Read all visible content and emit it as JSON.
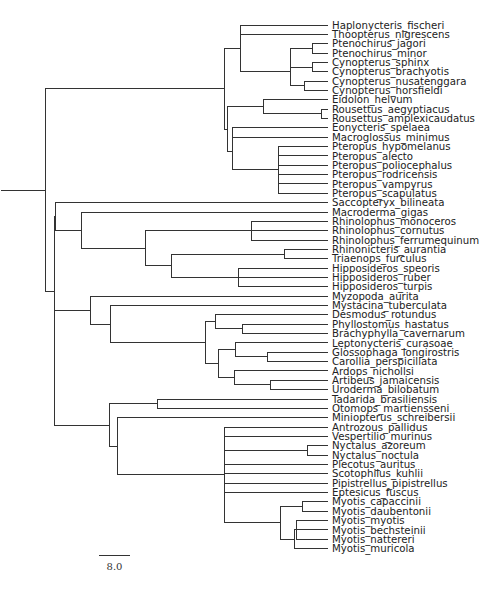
{
  "figure": {
    "type": "phylogenetic-tree",
    "scale_bar": {
      "label": "8.0",
      "x1": 99,
      "x2": 130,
      "y": 555
    }
  },
  "leaf_layout": {
    "x_label": 332,
    "y_start": 25,
    "y_step": 9.35
  },
  "leaves": [
    "Haplonycteris_fischeri",
    "Thoopterus_nigrescens",
    "Ptenochirus_jagori",
    "Ptenochirus_minor",
    "Cynopterus_sphinx",
    "Cynopterus_brachyotis",
    "Cynopterus_nusatenggara",
    "Cynopterus_horsfieldi",
    "Eidolon_helvum",
    "Rousettus_aegyptiacus",
    "Rousettus_amplexicaudatus",
    "Eonycteris_spelaea",
    "Macroglossus_minimus",
    "Pteropus_hypomelanus",
    "Pteropus_alecto",
    "Pteropus_poliocephalus",
    "Pteropus_rodricensis",
    "Pteropus_vampyrus",
    "Pteropus_scapulatus",
    "Saccopteryx_bilineata",
    "Macroderma_gigas",
    "Rhinolophus_monoceros",
    "Rhinolophus_cornutus",
    "Rhinolophus_ferrumequinum",
    "Rhinonicteris_aurantia",
    "Triaenops_furculus",
    "Hipposideros_speoris",
    "Hipposideros_ruber",
    "Hipposideros_turpis",
    "Myzopoda_aurita",
    "Mystacina_tuberculata",
    "Desmodus_rotundus",
    "Phyllostomus_hastatus",
    "Brachyphylla_cavernarum",
    "Leptonycteris_curasoae",
    "Glossophaga_longirostris",
    "Carollia_perspicillata",
    "Ardops_nichollsi",
    "Artibeus_jamaicensis",
    "Uroderma_bilobatum",
    "Tadarida_brasiliensis",
    "Otomops_martiensseni",
    "Miniopterus_schreibersii",
    "Antrozous_pallidus",
    "Vespertilio_murinus",
    "Nyctalus_azoreum",
    "Nyctalus_noctula",
    "Plecotus_auritus",
    "Scotophilus_kuhlii",
    "Pipistrellus_pipistrellus",
    "Eptesicus_fuscus",
    "Myotis_capaccinii",
    "Myotis_daubentonii",
    "Myotis_myotis",
    "Myotis_bechsteinii",
    "Myotis_nattereri",
    "Myotis_muricola"
  ],
  "tree": {
    "x": 15,
    "c": [
      {
        "x": 45,
        "c": [
          {
            "x": 224,
            "c": [
              {
                "x": 240,
                "c": [
                  {
                    "x": 240,
                    "c": [
                      0,
                      1,
                      {
                        "x": 290,
                        "c": [
                          {
                            "x": 290,
                            "c": [
                              {
                                "x": 312,
                                "c": [
                                  2,
                                  3
                                ]
                              },
                              {
                                "x": 312,
                                "c": [
                                  4,
                                  5
                                ]
                              }
                            ]
                          },
                          {
                            "x": 304,
                            "c": [
                              6,
                              7
                            ]
                          }
                        ]
                      }
                    ]
                  }
                ]
              },
              {
                "x": 227,
                "c": [
                  {
                    "x": 263,
                    "c": [
                      8,
                      {
                        "x": 321,
                        "c": [
                          9,
                          10
                        ]
                      }
                    ]
                  },
                  {
                    "x": 232,
                    "c": [
                      {
                        "x": 232,
                        "c": [
                          11,
                          12
                        ]
                      },
                      {
                        "x": 278,
                        "c": [
                          13,
                          14,
                          15,
                          16,
                          17,
                          18
                        ]
                      }
                    ]
                  }
                ]
              }
            ]
          },
          {
            "x": 54,
            "c": [
              {
                "x": 55,
                "c": [
                  19,
                  {
                    "x": 81,
                    "c": [
                      20,
                      {
                        "x": 145,
                        "c": [
                          {
                            "x": 251,
                            "c": [
                              21,
                              22,
                              23
                            ]
                          },
                          {
                            "x": 171,
                            "c": [
                              {
                                "x": 284,
                                "c": [
                                  24,
                                  25
                                ]
                              },
                              {
                                "x": 238,
                                "c": [
                                  26,
                                  27,
                                  28
                                ]
                              }
                            ]
                          }
                        ]
                      }
                    ]
                  }
                ]
              },
              {
                "x": 54,
                "c": [
                  {
                    "x": 90,
                    "c": [
                      29,
                      {
                        "x": 110,
                        "c": [
                          30,
                          {
                            "x": 205,
                            "c": [
                              {
                                "x": 215,
                                "c": [
                                  31,
                                  {
                                    "x": 242,
                                    "c": [
                                      32,
                                      33
                                    ]
                                  }
                                ]
                              },
                              {
                                "x": 218,
                                "c": [
                                  {
                                    "x": 235,
                                    "c": [
                                      34,
                                      {
                                        "x": 267,
                                        "c": [
                                          35,
                                          36
                                        ]
                                      }
                                    ]
                                  },
                                  {
                                    "x": 234,
                                    "c": [
                                      37,
                                      {
                                        "x": 270,
                                        "c": [
                                          38,
                                          39
                                        ]
                                      }
                                    ]
                                  }
                                ]
                              }
                            ]
                          }
                        ]
                      }
                    ]
                  },
                  {
                    "x": 109,
                    "c": [
                      {
                        "x": 157,
                        "c": [
                          40,
                          41
                        ]
                      },
                      {
                        "x": 117,
                        "c": [
                          42,
                          {
                            "x": 224,
                            "c": [
                              43,
                              44,
                              {
                                "x": 307,
                                "c": [
                                  45,
                                  46
                                ]
                              },
                              47,
                              48,
                              49,
                              50,
                              {
                                "x": 280,
                                "c": [
                                  {
                                    "x": 302,
                                    "c": [
                                      51,
                                      52
                                    ]
                                  },
                                  {
                                    "x": 294,
                                    "c": [
                                      {
                                        "x": 296,
                                        "c": [
                                          53,
                                          54,
                                          55
                                        ]
                                      },
                                      56
                                    ]
                                  }
                                ]
                              }
                            ]
                          }
                        ]
                      }
                    ]
                  }
                ]
              }
            ]
          }
        ]
      }
    ]
  }
}
